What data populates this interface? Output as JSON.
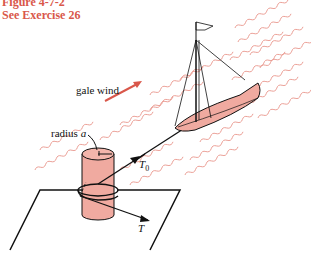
{
  "caption": {
    "figure": "Figure 4-7-2",
    "exercise": "See Exercise 26"
  },
  "labels": {
    "wind": "gale wind",
    "radius_prefix": "radius ",
    "radius_var": "a",
    "tension_in": "T",
    "tension_in_sub": "0",
    "tension_out": "T"
  },
  "colors": {
    "accent": "#d9574a",
    "fill": "#f0aaa0",
    "wave": "#e8948a",
    "line": "#111111"
  }
}
